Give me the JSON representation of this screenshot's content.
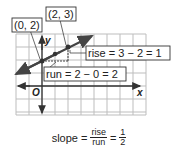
{
  "graph": {
    "axes": {
      "x_label": "x",
      "y_label": "y",
      "origin_label": "O"
    },
    "points": [
      {
        "label": "(0, 2)",
        "x": 0,
        "y": 2
      },
      {
        "label": "(2, 3)",
        "x": 2,
        "y": 3
      }
    ],
    "annotations": {
      "rise": "rise = 3 − 2 = 1",
      "run": "run = 2 − 0 = 2"
    },
    "colors": {
      "line": "#444444",
      "grid": "#bbbbbb",
      "axis": "#333333"
    }
  },
  "formula": {
    "prefix": "slope =",
    "fraction1": {
      "numerator": "rise",
      "denominator": "run"
    },
    "equals": "=",
    "fraction2": {
      "numerator": "1",
      "denominator": "2"
    }
  }
}
